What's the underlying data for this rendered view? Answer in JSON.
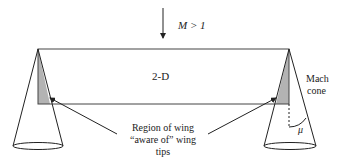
{
  "diagram": {
    "flow_label": "M > 1",
    "wing_label": "2-D",
    "cone_label_line1": "Mach",
    "cone_label_line2": "cone",
    "angle_label": "μ",
    "region_label_line1": "Region of wing",
    "region_label_line2": "“aware of” wing",
    "region_label_line3": "tips",
    "colors": {
      "line": "#222222",
      "shaded_region": "#b3b3b3",
      "background": "#ffffff"
    }
  }
}
